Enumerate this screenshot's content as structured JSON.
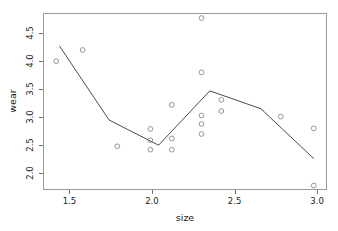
{
  "chart_data": {
    "type": "scatter",
    "title": "",
    "xlabel": "size",
    "ylabel": "wear",
    "xlim": [
      1.34,
      3.06
    ],
    "ylim": [
      1.7,
      4.86
    ],
    "grid": false,
    "legend": "none",
    "xticks": [
      1.5,
      2.0,
      2.5,
      3.0
    ],
    "xtick_labels": [
      "1.5",
      "2.0",
      "2.5",
      "3.0"
    ],
    "yticks": [
      2.0,
      2.5,
      3.0,
      3.5,
      4.0,
      4.5
    ],
    "ytick_labels": [
      "2.0",
      "2.5",
      "3.0",
      "3.5",
      "4.0",
      "4.5"
    ],
    "point_marker": "open-circle",
    "point_color": "#8a8a8a",
    "line_color": "#4a4a4a",
    "frame_color": "#9a9a9a",
    "series": [
      {
        "name": "wear observations",
        "type": "scatter",
        "points": [
          {
            "x": 1.42,
            "y": 4.0
          },
          {
            "x": 1.58,
            "y": 4.2
          },
          {
            "x": 1.79,
            "y": 2.48
          },
          {
            "x": 1.99,
            "y": 2.79
          },
          {
            "x": 1.99,
            "y": 2.59
          },
          {
            "x": 1.99,
            "y": 2.42
          },
          {
            "x": 2.12,
            "y": 3.22
          },
          {
            "x": 2.12,
            "y": 2.62
          },
          {
            "x": 2.12,
            "y": 2.42
          },
          {
            "x": 2.3,
            "y": 4.77
          },
          {
            "x": 2.3,
            "y": 3.8
          },
          {
            "x": 2.3,
            "y": 3.03
          },
          {
            "x": 2.3,
            "y": 2.88
          },
          {
            "x": 2.3,
            "y": 2.7
          },
          {
            "x": 2.42,
            "y": 3.31
          },
          {
            "x": 2.42,
            "y": 3.11
          },
          {
            "x": 2.78,
            "y": 3.01
          },
          {
            "x": 2.98,
            "y": 2.8
          },
          {
            "x": 2.98,
            "y": 1.78
          }
        ]
      },
      {
        "name": "fitted line",
        "type": "line",
        "points": [
          {
            "x": 1.44,
            "y": 4.27
          },
          {
            "x": 1.74,
            "y": 2.95
          },
          {
            "x": 2.04,
            "y": 2.5
          },
          {
            "x": 2.35,
            "y": 3.47
          },
          {
            "x": 2.66,
            "y": 3.15
          },
          {
            "x": 2.98,
            "y": 2.26
          }
        ]
      }
    ]
  }
}
